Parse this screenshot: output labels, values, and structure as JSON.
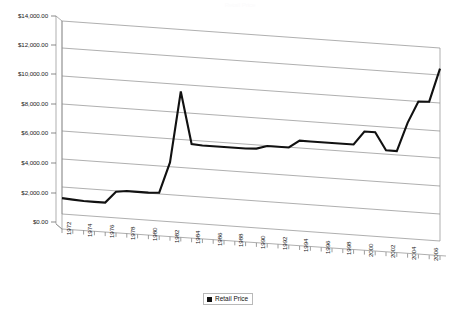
{
  "chart_title": "Retail Price",
  "legend": {
    "label": "Retail Price",
    "swatch_color": "#111111",
    "position": "bottom-center"
  },
  "axis": {
    "y_tick_labels": [
      "$14,000.00",
      "$12,000.00",
      "$10,000.00",
      "$8,000.00",
      "$6,000.00",
      "$4,000.00",
      "$2,000.00",
      "$0.00"
    ],
    "x_tick_labels": [
      "1972",
      "1974",
      "1976",
      "1978",
      "1980",
      "1982",
      "1984",
      "1986",
      "1988",
      "1990",
      "1992",
      "1994",
      "1996",
      "1998",
      "2000",
      "2002",
      "2004",
      "2006"
    ]
  },
  "colors": {
    "series_line": "#111111",
    "gridline": "#8c8c8c",
    "axis_line": "#8c8c8c",
    "plot_background": "#ffffff",
    "page_background": "#ffffff",
    "text": "#1a1a1a"
  },
  "chart_data": {
    "type": "line",
    "title": "Retail Price",
    "xlabel": "",
    "ylabel": "",
    "ylim": [
      0,
      14000
    ],
    "ytick_step": 2000,
    "grid": true,
    "legend_position": "bottom-center",
    "style_note": "3D perspective line chart, gridlines recede to the right",
    "x": [
      1972,
      1973,
      1974,
      1975,
      1976,
      1977,
      1978,
      1979,
      1980,
      1981,
      1982,
      1983,
      1984,
      1985,
      1986,
      1987,
      1988,
      1989,
      1990,
      1991,
      1992,
      1993,
      1994,
      1995,
      1996,
      1997,
      1998,
      1999,
      2000,
      2001,
      2002,
      2003,
      2004,
      2005,
      2006,
      2007
    ],
    "categories": [
      "1972",
      "1973",
      "1974",
      "1975",
      "1976",
      "1977",
      "1978",
      "1979",
      "1980",
      "1981",
      "1982",
      "1983",
      "1984",
      "1985",
      "1986",
      "1987",
      "1988",
      "1989",
      "1990",
      "1991",
      "1992",
      "1993",
      "1994",
      "1995",
      "1996",
      "1997",
      "1998",
      "1999",
      "2000",
      "2001",
      "2002",
      "2003",
      "2004",
      "2005",
      "2006",
      "2007"
    ],
    "series": [
      {
        "name": "Retail Price",
        "values": [
          1150,
          1100,
          1050,
          1050,
          1050,
          1900,
          2000,
          2000,
          2000,
          2050,
          4300,
          9500,
          5750,
          5700,
          5700,
          5700,
          5700,
          5700,
          5750,
          6000,
          6000,
          6000,
          6550,
          6550,
          6550,
          6550,
          6550,
          6550,
          7550,
          7550,
          6300,
          6300,
          8400,
          10000,
          10050,
          12500
        ]
      }
    ]
  }
}
